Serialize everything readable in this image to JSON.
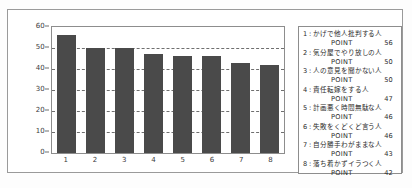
{
  "chart_data": {
    "type": "bar",
    "title": "",
    "xlabel": "",
    "ylabel": "",
    "ylim": [
      0,
      60
    ],
    "grid": true,
    "legend_position": "right",
    "categories": [
      "1",
      "2",
      "3",
      "4",
      "5",
      "6",
      "7",
      "8"
    ],
    "values": [
      56,
      50,
      50,
      47,
      46,
      46,
      43,
      42
    ],
    "yticks": [
      "0",
      "10",
      "20",
      "30",
      "40",
      "50",
      "60"
    ],
    "ytick_values": [
      0,
      10,
      20,
      30,
      40,
      50,
      60
    ],
    "series": [
      {
        "name": "POINT",
        "values": [
          56,
          50,
          50,
          47,
          46,
          46,
          43,
          42
        ]
      }
    ],
    "bar_color": "#4a4a4a",
    "legend_entries": [
      {
        "index": "1",
        "label": "かげで他人批判する人",
        "point_label": "POINT",
        "point": "56"
      },
      {
        "index": "2",
        "label": "気分屋でやり放しの人",
        "point_label": "POINT",
        "point": "50"
      },
      {
        "index": "3",
        "label": "人の意見を聞かない人",
        "point_label": "POINT",
        "point": "50"
      },
      {
        "index": "4",
        "label": "責任転嫁をする人",
        "point_label": "POINT",
        "point": "47"
      },
      {
        "index": "5",
        "label": "計画悪く時間無駄な人",
        "point_label": "POINT",
        "point": "46"
      },
      {
        "index": "6",
        "label": "失敗をくどくど言う人",
        "point_label": "POINT",
        "point": "46"
      },
      {
        "index": "7",
        "label": "自分勝手わがままな人",
        "point_label": "POINT",
        "point": "43"
      },
      {
        "index": "8",
        "label": "落ち着かずイラつく人",
        "point_label": "POINT",
        "point": "42"
      }
    ]
  }
}
